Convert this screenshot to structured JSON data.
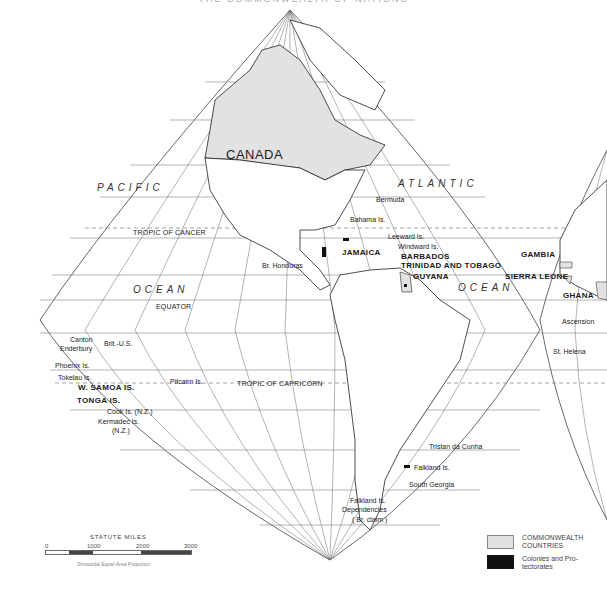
{
  "title": "THE COMMONWEALTH OF NATIONS",
  "map": {
    "projection": "Sinusoidal Equal-Area Projection",
    "lines": {
      "tropic_of_cancer": "TROPIC OF CANCER",
      "equator": "EQUATOR",
      "tropic_of_capricorn": "TROPIC OF CAPRICORN"
    },
    "oceans": {
      "pacific": "PACIFIC",
      "pacific_ocean": "OCEAN",
      "atlantic": "ATLANTIC",
      "atlantic_ocean": "OCEAN"
    },
    "countries": {
      "canada": "CANADA",
      "jamaica": "JAMAICA",
      "barbados": "BARBADOS",
      "trinidad": "TRINIDAD AND TOBAGO",
      "guyana": "GUYANA",
      "gambia": "GAMBIA",
      "sierra_leone": "SIERRA LEONE",
      "ghana": "GHANA",
      "w_samoa": "W. SAMOA IS.",
      "tonga": "TONGA IS."
    },
    "places": {
      "bermuda": "Bermuda",
      "bahama": "Bahama Is.",
      "leeward": "Leeward Is.",
      "windward": "Windward Is.",
      "br_honduras": "Br. Honduras",
      "ascension": "Ascension",
      "st_helena": "St. Helena",
      "canton": "Canton",
      "enderbury": "Enderbury",
      "brit_us": "Brit.-U.S.",
      "phoenix": "Phoenix Is.",
      "tokelau": "Tokelau Is.",
      "pitcairn": "Pitcairn Is.",
      "cook": "Cook Is. (N.Z.)",
      "kermadec": "Kermadec Is.",
      "kermadec_nz": "(N.Z.)",
      "tristan": "Tristan da Cunha",
      "falkland": "Falkland Is.",
      "south_georgia": "South Georgia",
      "falkland_dep_1": "Falkland Is.",
      "falkland_dep_2": "Dependencies",
      "falkland_dep_3": "( Br. claim )"
    }
  },
  "scale": {
    "title": "STATUTE MILES",
    "ticks": [
      "0",
      "1000",
      "2000",
      "3000"
    ],
    "projection_note": "Sinusoidal Equal-Area Projection"
  },
  "legend": {
    "items": [
      {
        "label_1": "COMMONWEALTH",
        "label_2": "COUNTRIES",
        "color": "#e2e2e2"
      },
      {
        "label_1": "Colonies and Pro-",
        "label_2": "tectorates",
        "color": "#111111"
      }
    ]
  },
  "colors": {
    "commonwealth_fill": "#e2e2e2",
    "colony_fill": "#111111",
    "grid": "#555555",
    "coast": "#222222"
  }
}
